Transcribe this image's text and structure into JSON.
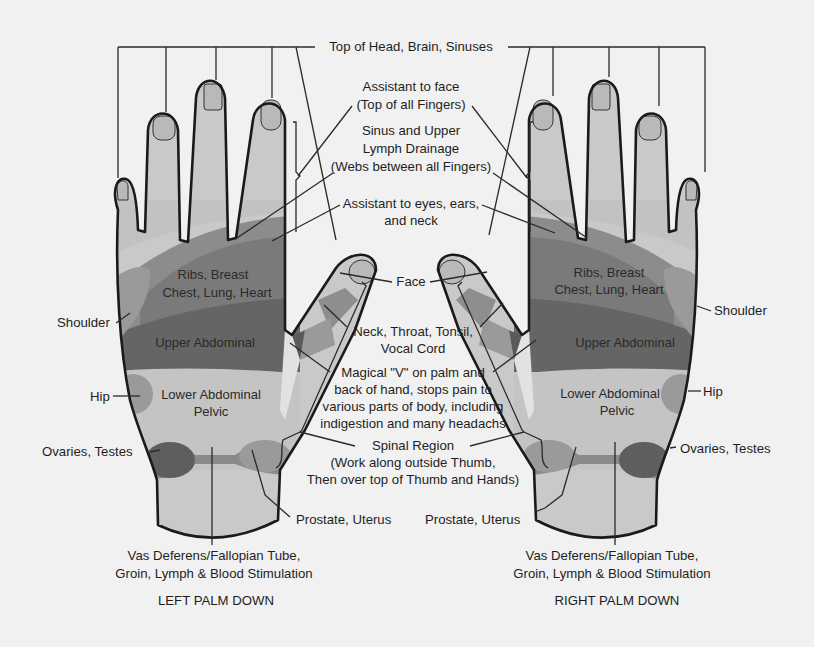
{
  "diagram": {
    "colors": {
      "background": "#f1f1f1",
      "skin": "#c9c9c9",
      "nail": "#b9b9b9",
      "light_zone": "#bdbdbd",
      "mid_zone": "#8e8e8e",
      "dark_zone": "#6a6a6a",
      "darker_zone": "#5a5a5a",
      "outline": "#1a1a1a"
    },
    "hands": {
      "left": {
        "caption": "LEFT PALM DOWN",
        "zones": {
          "ribs": [
            "Ribs, Breast",
            "Chest, Lung, Heart"
          ],
          "upper_abdominal": "Upper Abdominal",
          "lower_abdominal": [
            "Lower Abdominal",
            "Pelvic"
          ]
        },
        "side_labels": {
          "shoulder": "Shoulder",
          "hip": "Hip",
          "ovaries": "Ovaries, Testes",
          "prostate": "Prostate, Uterus",
          "vas": [
            "Vas Deferens/Fallopian Tube,",
            "Groin, Lymph & Blood Stimulation"
          ]
        }
      },
      "right": {
        "caption": "RIGHT PALM DOWN",
        "zones": {
          "ribs": [
            "Ribs, Breast",
            "Chest, Lung, Heart"
          ],
          "upper_abdominal": "Upper Abdominal",
          "lower_abdominal": [
            "Lower Abdominal",
            "Pelvic"
          ]
        },
        "side_labels": {
          "shoulder": "Shoulder",
          "hip": "Hip",
          "ovaries": "Ovaries, Testes",
          "prostate": "Prostate, Uterus",
          "vas": [
            "Vas Deferens/Fallopian Tube,",
            "Groin, Lymph & Blood Stimulation"
          ]
        }
      }
    },
    "center_labels": {
      "top_of_head": "Top of Head, Brain, Sinuses",
      "assistant_face": [
        "Assistant to face",
        "(Top of all Fingers)"
      ],
      "sinus": [
        "Sinus and Upper",
        "Lymph Drainage",
        "(Webs between all Fingers)"
      ],
      "assistant_eyes": [
        "Assistant to eyes, ears,",
        "and neck"
      ],
      "face": "Face",
      "neck": [
        "Neck, Throat, Tonsil,",
        "Vocal Cord"
      ],
      "magical_v": [
        "Magical \"V\" on palm and",
        "back of hand, stops pain to",
        "various parts of body, including",
        "indigestion and many headachs"
      ],
      "spinal": [
        "Spinal Region",
        "(Work along outside Thumb,",
        "Then over top of Thumb and Hands)"
      ]
    }
  }
}
